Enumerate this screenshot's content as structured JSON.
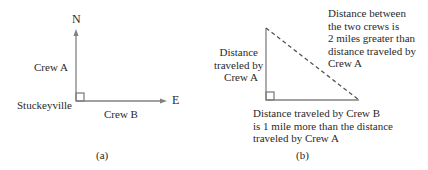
{
  "panel_a": {
    "north_label": "N",
    "east_label": "E",
    "crew_a_label": "Crew A",
    "crew_b_label": "Crew B",
    "origin_label": "Stuckeyville",
    "caption": "(a)"
  },
  "panel_b": {
    "vertical_label": [
      "Distance",
      "traveled by",
      "Crew A"
    ],
    "hypotenuse_label": [
      "Distance between",
      "the two crews is",
      "2 miles greater than",
      "distance traveled by",
      "Crew A"
    ],
    "base_label": [
      "Distance traveled by Crew B",
      "is 1 mile more than the distance",
      "traveled by Crew A"
    ],
    "caption": "(b)"
  },
  "colors": {
    "line": "#808080",
    "text": "#2a2a2a"
  }
}
